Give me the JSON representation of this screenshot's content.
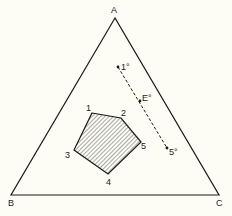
{
  "diagram": {
    "type": "ternary-diagram",
    "vertices": {
      "A": {
        "label": "A",
        "x": 115,
        "y": 18
      },
      "B": {
        "label": "B",
        "x": 11,
        "y": 195
      },
      "C": {
        "label": "C",
        "x": 219,
        "y": 195
      }
    },
    "region": {
      "name": "hatched-pentagon",
      "points": [
        {
          "label": "1",
          "x": 92,
          "y": 113
        },
        {
          "label": "2",
          "x": 121,
          "y": 118
        },
        {
          "label": "5",
          "x": 141,
          "y": 142
        },
        {
          "label": "4",
          "x": 108,
          "y": 174
        },
        {
          "label": "3",
          "x": 74,
          "y": 150
        }
      ]
    },
    "dashed_line": {
      "points": [
        {
          "label": "1°",
          "x": 118,
          "y": 67
        },
        {
          "label": "E°",
          "x": 140,
          "y": 101
        },
        {
          "label": "5°",
          "x": 167,
          "y": 148
        }
      ]
    },
    "colors": {
      "stroke": "#1a1a1a",
      "background": "#fdfdf6",
      "hatch": "#555555"
    }
  }
}
